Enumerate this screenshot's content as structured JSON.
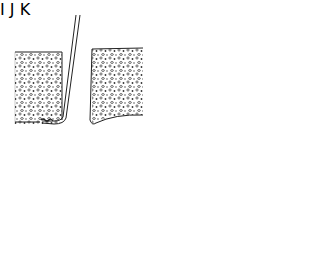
{
  "figure": {
    "panels": [
      {
        "label": "I",
        "caption": "Probe tip curved at base of gap between two bone segments"
      },
      {
        "label": "J",
        "caption": "Probe tip with hatched graft material at base of right segment"
      },
      {
        "label": "K",
        "caption": "Hatched graft block filling gap between two bone segments"
      }
    ],
    "signature": "artist signature (vertical)"
  },
  "colors": {
    "ink": "#222222",
    "background": "#ffffff"
  }
}
